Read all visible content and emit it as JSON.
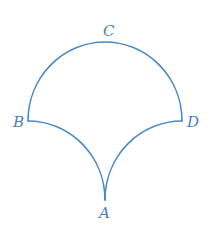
{
  "diagram": {
    "colors": {
      "stroke": "#4a8ac8",
      "label": "#4a7fbf",
      "background": "#ffffff"
    },
    "points": {
      "A": {
        "label": "A",
        "x": 105,
        "y": 200
      },
      "B": {
        "label": "B",
        "x": 28,
        "y": 121
      },
      "C": {
        "label": "C",
        "x": 105,
        "y": 42
      },
      "D": {
        "label": "D",
        "x": 182,
        "y": 121
      }
    },
    "arcs": [
      {
        "name": "arc-BCD",
        "from": "B",
        "to": "D",
        "through": "C",
        "type": "semicircle"
      },
      {
        "name": "arc-BA",
        "from": "B",
        "to": "A",
        "type": "quarter-circle"
      },
      {
        "name": "arc-DA",
        "from": "D",
        "to": "A",
        "type": "quarter-circle"
      }
    ],
    "labels": {
      "A": "A",
      "B": "B",
      "C": "C",
      "D": "D"
    }
  }
}
